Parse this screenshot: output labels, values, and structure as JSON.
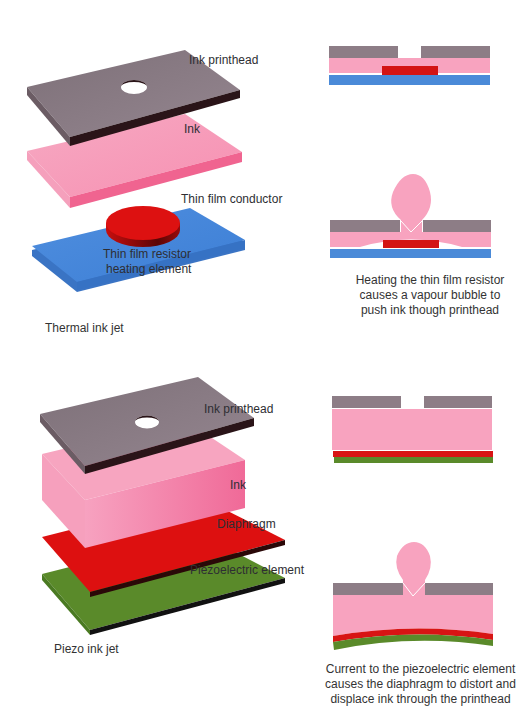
{
  "thermal": {
    "title": "Thermal ink jet",
    "labels": {
      "printhead": "Ink printhead",
      "ink": "Ink",
      "conductor": "Thin film conductor",
      "resistor_line1": "Thin film resistor",
      "resistor_line2": "heating element"
    },
    "caption": {
      "line1": "Heating the thin film resistor",
      "line2": "causes a vapour bubble to",
      "line3": "push ink though printhead"
    }
  },
  "piezo": {
    "title": "Piezo ink jet",
    "labels": {
      "printhead": "Ink printhead",
      "ink": "Ink",
      "diaphragm": "Diaphragm",
      "piezo": "Piezoelectric element"
    },
    "caption": {
      "line1": "Current to the piezoelectric element",
      "line2": "causes the diaphragm to distort and",
      "line3": "displace ink through the printhead"
    }
  },
  "colors": {
    "printhead": "#8a7a82",
    "printhead_edge": "#2a1418",
    "ink": "#f7a1bd",
    "ink_edge": "#ef5f8c",
    "conductor": "#4a8ad8",
    "resistor": "#dd1111",
    "diaphragm": "#dd1010",
    "piezo": "#5a8a2a"
  }
}
